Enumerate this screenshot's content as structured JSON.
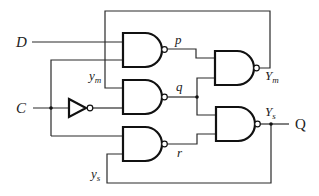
{
  "diagram": {
    "type": "logic-circuit",
    "inputs": {
      "d": "D",
      "c": "C"
    },
    "output": "Q",
    "signals": {
      "p": "p",
      "q": "q",
      "r": "r",
      "ym_main": "y",
      "ym_sub": "m",
      "ys_main": "y",
      "ys_sub": "s",
      "Ym_main": "Y",
      "Ym_sub": "m",
      "Ys_main": "Y",
      "Ys_sub": "s"
    },
    "gates": [
      {
        "id": "nand-p",
        "type": "NAND",
        "inputs": [
          "D",
          "C"
        ],
        "output": "p"
      },
      {
        "id": "nand-q",
        "type": "NAND",
        "inputs": [
          "y_m",
          "C'"
        ],
        "output": "q"
      },
      {
        "id": "nand-r",
        "type": "NAND",
        "inputs": [
          "C",
          "y_s"
        ],
        "output": "r"
      },
      {
        "id": "nand-Ym",
        "type": "NAND",
        "inputs": [
          "p",
          "q"
        ],
        "output": "Y_m"
      },
      {
        "id": "nand-Ys",
        "type": "NAND",
        "inputs": [
          "q",
          "r"
        ],
        "output": "Y_s"
      },
      {
        "id": "inverter",
        "type": "NOT",
        "inputs": [
          "C"
        ],
        "output": "C'"
      }
    ]
  }
}
